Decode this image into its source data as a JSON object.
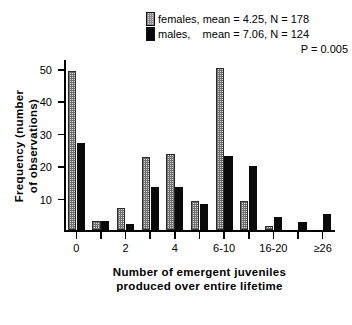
{
  "legend": {
    "females_label": "females, mean = 4.25, N = 178",
    "males_label": "males,    mean = 7.06, N = 124",
    "p_value": "P = 0.005",
    "female_swatch_name": "stippled-grey",
    "male_swatch_name": "solid-black",
    "female_color": "#d8d8d8",
    "male_color": "#0a0a0a"
  },
  "chart_data": {
    "type": "bar",
    "title": "",
    "xlabel_line1": "Number of emergent juveniles",
    "xlabel_line2": "produced over entire lifetime",
    "ylabel_line1": "Frequency (number",
    "ylabel_line2": "of observations)",
    "categories": [
      "0",
      "1",
      "2",
      "3",
      "4",
      "5",
      "6-10",
      "11-15",
      "16-20",
      "21-25",
      "≥26"
    ],
    "xtick_labels": [
      "0",
      "",
      "2",
      "",
      "4",
      "",
      "6-10",
      "",
      "16-20",
      "",
      "≥26"
    ],
    "ytick_labels": [
      "10",
      "20",
      "30",
      "40",
      "50"
    ],
    "yticks": [
      10,
      20,
      30,
      40,
      50
    ],
    "ylim": [
      0,
      53
    ],
    "grid": false,
    "legend_position": "top-right",
    "series": [
      {
        "name": "females",
        "color": "#d8d8d8",
        "values": [
          49,
          3,
          7,
          22.5,
          23.5,
          9,
          50,
          9,
          1.5,
          0,
          0
        ]
      },
      {
        "name": "males",
        "color": "#0a0a0a",
        "values": [
          27,
          3,
          2,
          13.5,
          13.5,
          8,
          23,
          20,
          4,
          2.5,
          5
        ]
      }
    ]
  }
}
